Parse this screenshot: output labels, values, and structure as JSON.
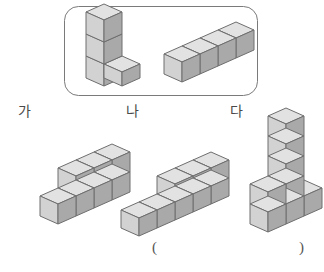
{
  "page": {
    "width": 324,
    "height": 272,
    "background": "#ffffff",
    "kind": "math-worksheet-figure"
  },
  "colors": {
    "cube_top": "#e2e2e2",
    "cube_left": "#d2d2d2",
    "cube_right": "#a9a9a9",
    "cube_outline": "#6e6e6e",
    "box_border": "#7a7a7a",
    "text": "#4a4a4a"
  },
  "prompt_box": {
    "name": "given-pieces-box",
    "x": 64,
    "y": 6,
    "width": 194,
    "height": 90,
    "corner_radius": 14,
    "pieces": [
      {
        "name": "piece-L",
        "description": "L-shaped piece: column of 3 cubes with 1 cube attached at bottom right",
        "cube_count": 4,
        "cells": [
          {
            "x": 0,
            "y": 0,
            "z": 0
          },
          {
            "x": 0,
            "y": 0,
            "z": 1
          },
          {
            "x": 0,
            "y": 0,
            "z": 2
          },
          {
            "x": 1,
            "y": 0,
            "z": 0
          }
        ]
      },
      {
        "name": "piece-bar",
        "description": "Straight bar of 4 cubes in a row",
        "cube_count": 4,
        "cells": [
          {
            "x": 0,
            "y": 0,
            "z": 0
          },
          {
            "x": 1,
            "y": 0,
            "z": 0
          },
          {
            "x": 2,
            "y": 0,
            "z": 0
          },
          {
            "x": 3,
            "y": 0,
            "z": 0
          }
        ]
      }
    ]
  },
  "choices": [
    {
      "id": "ga",
      "label": "가",
      "name": "choice-ga",
      "description": "Row of 4 cubes on the bottom with 3 cubes stacked on top of positions 2-4",
      "cube_count": 7,
      "cells": [
        {
          "x": 0,
          "y": 0,
          "z": 0
        },
        {
          "x": 1,
          "y": 0,
          "z": 0
        },
        {
          "x": 2,
          "y": 0,
          "z": 0
        },
        {
          "x": 3,
          "y": 0,
          "z": 0
        },
        {
          "x": 1,
          "y": 0,
          "z": 1
        },
        {
          "x": 2,
          "y": 0,
          "z": 1
        },
        {
          "x": 3,
          "y": 0,
          "z": 1
        }
      ]
    },
    {
      "id": "na",
      "label": "나",
      "name": "choice-na",
      "description": "Row of 5 cubes on the bottom with 3 cubes stacked on top of positions 3-5",
      "cube_count": 8,
      "cells": [
        {
          "x": 0,
          "y": 0,
          "z": 0
        },
        {
          "x": 1,
          "y": 0,
          "z": 0
        },
        {
          "x": 2,
          "y": 0,
          "z": 0
        },
        {
          "x": 3,
          "y": 0,
          "z": 0
        },
        {
          "x": 4,
          "y": 0,
          "z": 0
        },
        {
          "x": 2,
          "y": 0,
          "z": 1
        },
        {
          "x": 3,
          "y": 0,
          "z": 1
        },
        {
          "x": 4,
          "y": 0,
          "z": 1
        }
      ]
    },
    {
      "id": "da",
      "label": "다",
      "name": "choice-da",
      "description": "Base row of 3 cubes with a vertical tower of 3 more cubes rising from the middle column",
      "cube_count": 8,
      "cells": [
        {
          "x": 0,
          "y": 0,
          "z": 0
        },
        {
          "x": 1,
          "y": 0,
          "z": 0
        },
        {
          "x": 2,
          "y": 0,
          "z": 0
        },
        {
          "x": 0,
          "y": 0,
          "z": 1
        },
        {
          "x": 1,
          "y": 0,
          "z": 1
        },
        {
          "x": 1,
          "y": 0,
          "z": 2
        },
        {
          "x": 1,
          "y": 0,
          "z": 3
        },
        {
          "x": 1,
          "y": 0,
          "z": 4
        }
      ]
    }
  ],
  "answer": {
    "name": "answer-blank",
    "open_paren": "(",
    "close_paren": ")",
    "value": ""
  }
}
